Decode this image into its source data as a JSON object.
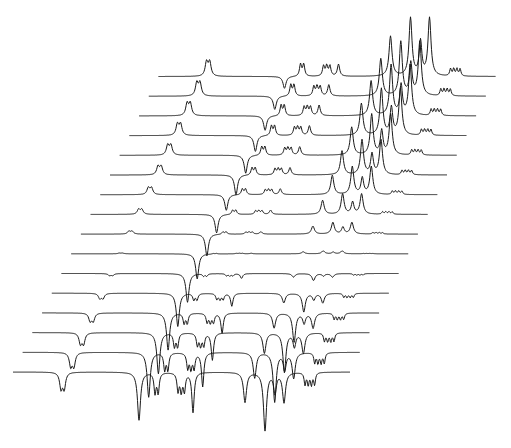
{
  "figure": {
    "background": "#ffffff",
    "line_color": "#1a1a1a"
  },
  "chart_data": {
    "type": "line",
    "title": "",
    "xlabel": "",
    "ylabel": "",
    "grid": false,
    "legend": null,
    "layout": {
      "trace_count": 16,
      "bottom_trace_origin": [
        13,
        372
      ],
      "x_step_per_trace": 9.7,
      "y_step_per_trace": -19.7,
      "trace_length_px": 337
    },
    "peaks": [
      {
        "name": "isolated-doublet",
        "pos": 48,
        "width": 1.6,
        "amp_neg": -16,
        "amp_pos": 14,
        "split": 2
      },
      {
        "name": "large-singlet",
        "pos": 126,
        "width": 1.8,
        "amp_neg": -48,
        "amp_pos": -20,
        "split": 0,
        "null_shift": 0.95
      },
      {
        "name": "multiplet-a",
        "pos": 142,
        "width": 1.2,
        "amp_neg": -20,
        "amp_pos": 12,
        "split": 2
      },
      {
        "name": "multiplet-b",
        "pos": 165,
        "width": 1.2,
        "amp_neg": -18,
        "amp_pos": 10,
        "split": 3
      },
      {
        "name": "multiplet-c",
        "pos": 180,
        "width": 1.4,
        "amp_neg": -40,
        "amp_pos": 12,
        "split": 0
      },
      {
        "name": "aromatic-1",
        "pos": 232,
        "width": 1.8,
        "amp_neg": -30,
        "amp_pos": 40,
        "split": 0
      },
      {
        "name": "aromatic-2",
        "pos": 252,
        "width": 1.8,
        "amp_neg": -58,
        "amp_pos": 58,
        "split": 0
      },
      {
        "name": "aromatic-3",
        "pos": 262,
        "width": 1.6,
        "amp_neg": -20,
        "amp_pos": 34,
        "split": 0
      },
      {
        "name": "aromatic-4",
        "pos": 271,
        "width": 1.8,
        "amp_neg": -30,
        "amp_pos": 58,
        "split": 0
      },
      {
        "name": "tail-multiplet",
        "pos": 292,
        "width": 1.0,
        "amp_neg": -12,
        "amp_pos": 7,
        "split": 4
      }
    ],
    "series_recovery_fraction": [
      -1.0,
      -0.85,
      -0.68,
      -0.5,
      -0.32,
      -0.12,
      0.05,
      0.2,
      0.35,
      0.48,
      0.6,
      0.7,
      0.8,
      0.87,
      0.93,
      1.0
    ]
  }
}
